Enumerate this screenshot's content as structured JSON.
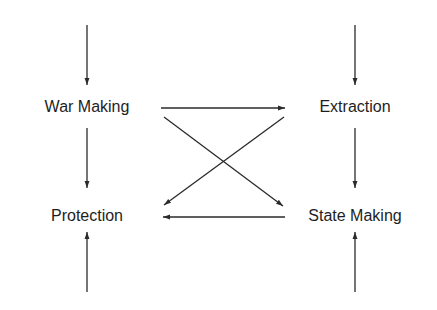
{
  "diagram": {
    "type": "flow-diagram",
    "colors": {
      "line": "#2a2a2a",
      "text": "#1e1e1e",
      "background": "#ffffff"
    },
    "nodes": [
      {
        "id": "war_making",
        "label": "War Making"
      },
      {
        "id": "extraction",
        "label": "Extraction"
      },
      {
        "id": "protection",
        "label": "Protection"
      },
      {
        "id": "state_making",
        "label": "State Making"
      }
    ],
    "edges": [
      {
        "from": "external_top_left",
        "to": "war_making"
      },
      {
        "from": "external_top_right",
        "to": "extraction"
      },
      {
        "from": "war_making",
        "to": "protection"
      },
      {
        "from": "extraction",
        "to": "state_making"
      },
      {
        "from": "war_making",
        "to": "extraction"
      },
      {
        "from": "war_making",
        "to": "state_making"
      },
      {
        "from": "extraction",
        "to": "protection"
      },
      {
        "from": "state_making",
        "to": "protection"
      },
      {
        "from": "external_bottom_left",
        "to": "protection"
      },
      {
        "from": "external_bottom_right",
        "to": "state_making"
      }
    ]
  }
}
